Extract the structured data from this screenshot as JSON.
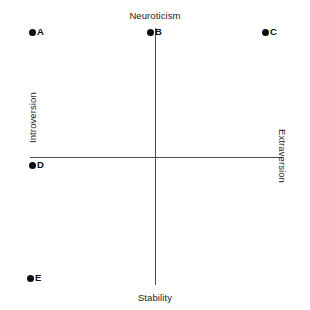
{
  "figure": {
    "title": "",
    "background_color": "#ffffff",
    "axis_color": "#4d4d4d",
    "point_color": "#0d0d0d",
    "label_color": "#1a1a1a"
  },
  "axes": {
    "vertical": {
      "top_label": "Neuroticism",
      "bottom_label": "Stability",
      "x": 155,
      "y_top": 28,
      "y_bottom": 285
    },
    "horizontal": {
      "left_label": "Introversion",
      "right_label": "Extraversion",
      "y": 157,
      "x_left": 30,
      "x_right": 283
    },
    "origin": {
      "x": 155,
      "y": 157
    }
  },
  "chart_data": {
    "type": "scatter",
    "title": "",
    "xlabel": "Introversion – Extraversion",
    "ylabel": "Stability – Neuroticism",
    "grid": false,
    "legend": false,
    "axis_labels": {
      "top": "Neuroticism",
      "bottom": "Stability",
      "left": "Introversion",
      "right": "Extraversion"
    },
    "origin_px": {
      "x": 155,
      "y": 157
    },
    "xlim_px": [
      30,
      283
    ],
    "ylim_px": [
      28,
      285
    ],
    "points": [
      {
        "label": "A",
        "x_px": 32,
        "y_px": 32,
        "quadrant": "introverted-neurotic"
      },
      {
        "label": "B",
        "x_px": 150,
        "y_px": 32,
        "quadrant": "neurotic-midline"
      },
      {
        "label": "C",
        "x_px": 265,
        "y_px": 32,
        "quadrant": "extraverted-neurotic"
      },
      {
        "label": "D",
        "x_px": 32,
        "y_px": 165,
        "quadrant": "introverted-stable"
      },
      {
        "label": "E",
        "x_px": 30,
        "y_px": 278,
        "quadrant": "introverted-stable"
      }
    ]
  }
}
